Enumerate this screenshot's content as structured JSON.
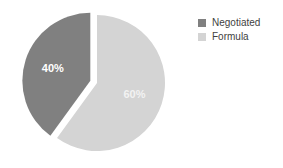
{
  "chart_data": {
    "type": "pie",
    "title": "",
    "subtitle": "",
    "xlabel": "",
    "ylabel": "",
    "grid": false,
    "legend_position": "right",
    "categories": [
      "Negotiated",
      "Formula"
    ],
    "values": [
      40,
      60
    ],
    "labels": [
      "40%",
      "60%"
    ],
    "colors": [
      "#808080",
      "#d4d4d4"
    ],
    "label_colors": [
      "#ffffff",
      "#f2f2f2"
    ],
    "exploded": [
      "Negotiated"
    ],
    "slices": [
      {
        "name": "Negotiated",
        "value": 40,
        "label": "40%",
        "color": "#808080",
        "exploded": true,
        "start_angle": 216,
        "end_angle": 360
      },
      {
        "name": "Formula",
        "value": 60,
        "label": "60%",
        "color": "#d4d4d4",
        "exploded": false,
        "start_angle": 0,
        "end_angle": 216
      }
    ]
  },
  "legend": {
    "items": [
      {
        "label": "Negotiated",
        "color": "#808080"
      },
      {
        "label": "Formula",
        "color": "#d4d4d4"
      }
    ]
  },
  "background": "#ffffff"
}
